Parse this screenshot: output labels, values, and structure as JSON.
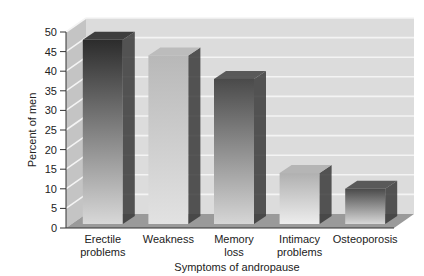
{
  "chart_data": {
    "type": "bar",
    "title": "",
    "xlabel": "Symptoms of andropause",
    "ylabel": "Percent of men",
    "categories": [
      [
        "Erectile",
        "problems"
      ],
      [
        "Weakness"
      ],
      [
        "Memory",
        "loss"
      ],
      [
        "Intimacy",
        "problems"
      ],
      [
        "Osteoporosis"
      ]
    ],
    "category_labels": [
      "Erectile problems",
      "Weakness",
      "Memory loss",
      "Intimacy problems",
      "Osteoporosis"
    ],
    "values": [
      47,
      43,
      37,
      13,
      9
    ],
    "ylim": [
      0,
      50
    ],
    "yticks": [
      0,
      5,
      10,
      15,
      20,
      25,
      30,
      35,
      40,
      45,
      50
    ],
    "grid": true,
    "legend": null,
    "style": "3d-grayscale",
    "bar_colors": {
      "Erectile problems": [
        "#2c2c2c",
        "#d8d8d8"
      ],
      "Weakness": [
        "#b8b8b8",
        "#e2e2e2"
      ],
      "Memory loss": [
        "#4a4a4a",
        "#d6d6d6"
      ],
      "Intimacy problems": [
        "#b0b0b0",
        "#ededed"
      ],
      "Osteoporosis": [
        "#4a4a4a",
        "#d8d8d8"
      ]
    }
  }
}
